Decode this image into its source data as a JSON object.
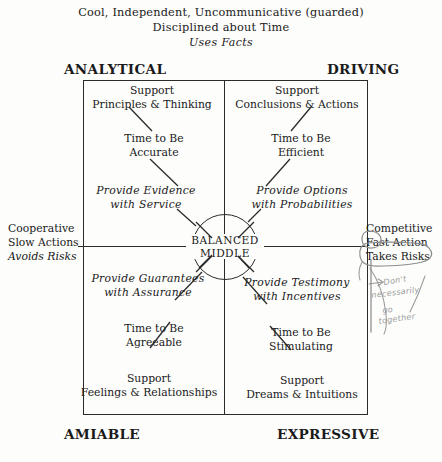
{
  "header": {
    "line1": "Cool, Independent, Uncommunicative (guarded)",
    "line2": "Disciplined about Time",
    "line3": "Uses Facts"
  },
  "corners": {
    "top_left": "ANALYTICAL",
    "top_right": "DRIVING",
    "bottom_left": "AMIABLE",
    "bottom_right": "EXPRESSIVE"
  },
  "center": {
    "line1": "BALANCED",
    "line2": "MIDDLE"
  },
  "axis_left": {
    "line1": "Cooperative",
    "line2": "Slow Actions",
    "line3": "Avoids Risks"
  },
  "axis_right": {
    "line1": "Competitive",
    "line2": "Fast Action",
    "line3": "Takes Risks"
  },
  "quadrants": {
    "analytical": {
      "support_line1": "Support",
      "support_line2": "Principles & Thinking",
      "time_line1": "Time to Be",
      "time_line2": "Accurate",
      "provide_line1": "Provide Evidence",
      "provide_line2": "with Service"
    },
    "driving": {
      "support_line1": "Support",
      "support_line2": "Conclusions & Actions",
      "time_line1": "Time to Be",
      "time_line2": "Efficient",
      "provide_line1": "Provide Options",
      "provide_line2": "with Probabilities"
    },
    "amiable": {
      "provide_line1": "Provide Guarantees",
      "provide_line2": "with Assurance",
      "time_line1": "Time to Be",
      "time_line2": "Agreeable",
      "support_line1": "Support",
      "support_line2": "Feelings & Relationships"
    },
    "expressive": {
      "provide_line1": "Provide Testimony",
      "provide_line2": "with Incentives",
      "time_line1": "Time to Be",
      "time_line2": "Stimulating",
      "support_line1": "Support",
      "support_line2": "Dreams & Intuitions"
    }
  },
  "annotation": {
    "line1": "Don't",
    "line2": "necessarily",
    "line3": "go",
    "line4": "together"
  },
  "colors": {
    "ink": "#2a2a2a",
    "pencil": "#8d8d8d",
    "paper": "#fdfdfc"
  }
}
